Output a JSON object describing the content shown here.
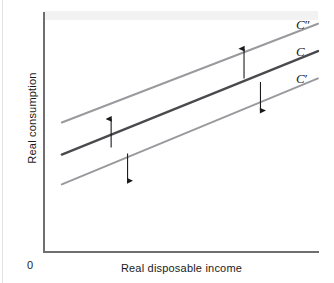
{
  "figure": {
    "name": "consumption-function-shift-diagram",
    "origin_label": "0",
    "background_color": "#ffffff",
    "axis_color": "#6f6f72"
  },
  "chart_data": {
    "type": "line",
    "title": "",
    "subtitle": "",
    "xlabel": "Real disposable income",
    "ylabel": "Real consumption",
    "xlim": [
      0,
      100
    ],
    "ylim": [
      0,
      100
    ],
    "grid": false,
    "legend_position": "right-of-line-ends",
    "axis_ticks": {
      "x": [],
      "y": []
    },
    "series": [
      {
        "name": "C″",
        "label": "C",
        "prime": "″",
        "color": "#9a9a9e",
        "width": 2.0,
        "x": [
          6.5,
          100.0
        ],
        "y": [
          54.0,
          95.5
        ],
        "description": "upward-shifted consumption function"
      },
      {
        "name": "C",
        "label": "C",
        "prime": "",
        "color": "#4a4a4e",
        "width": 2.4,
        "x": [
          6.5,
          100.0
        ],
        "y": [
          40.5,
          84.0
        ],
        "description": "baseline consumption function"
      },
      {
        "name": "C′",
        "label": "C",
        "prime": "′",
        "color": "#9a9a9e",
        "width": 2.0,
        "x": [
          6.5,
          100.0
        ],
        "y": [
          28.0,
          72.5
        ],
        "description": "downward-shifted consumption function"
      }
    ],
    "annotations": [
      {
        "name": "shift-up-arrow-left",
        "direction": "up",
        "meaning": "upward shift of the consumption function",
        "x": 24.5,
        "y_from": 43.5,
        "y_to": 55.5,
        "color": "#1b1b1b"
      },
      {
        "name": "shift-down-arrow-left",
        "direction": "down",
        "meaning": "downward shift of the consumption function",
        "x": 30.5,
        "y_from": 41.0,
        "y_to": 29.5,
        "color": "#1b1b1b"
      },
      {
        "name": "shift-up-arrow-right",
        "direction": "up",
        "meaning": "upward shift of the consumption function",
        "x": 73.0,
        "y_from": 72.5,
        "y_to": 85.0,
        "color": "#1b1b1b"
      },
      {
        "name": "shift-down-arrow-right",
        "direction": "down",
        "meaning": "downward shift of the consumption function",
        "x": 79.0,
        "y_from": 71.0,
        "y_to": 59.0,
        "color": "#1b1b1b"
      }
    ]
  }
}
